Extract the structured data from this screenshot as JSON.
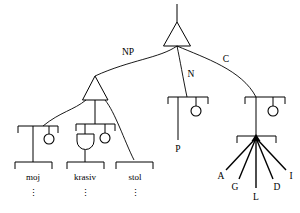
{
  "diagram": {
    "type": "linguistic-dependency-tree",
    "background_color": "#ffffff",
    "line_color": "#000000"
  },
  "labels": {
    "np": "NP",
    "n": "N",
    "c": "C",
    "p": "P"
  },
  "words": {
    "moj": "moj",
    "krasiv": "krasiv",
    "stol": "stol"
  },
  "ellipsis": {
    "moj": "⋮",
    "krasiv": "⋮",
    "stol": "⋮"
  },
  "fan_letters": {
    "a": "A",
    "g": "G",
    "l": "L",
    "d": "D",
    "i": "I"
  },
  "nodes": [
    {
      "name": "root-triangle",
      "kind": "triangle"
    },
    {
      "name": "np-triangle",
      "kind": "triangle"
    },
    {
      "name": "moj-bracket",
      "kind": "bracket"
    },
    {
      "name": "krasiv-bracket",
      "kind": "bracket"
    },
    {
      "name": "stol-bracket",
      "kind": "bracket"
    },
    {
      "name": "n-bracket",
      "kind": "bracket"
    },
    {
      "name": "c-bracket",
      "kind": "bracket"
    },
    {
      "name": "fan-bracket",
      "kind": "bracket"
    }
  ],
  "edges": [
    {
      "from": "root-triangle",
      "to": "np-triangle",
      "label": "NP"
    },
    {
      "from": "root-triangle",
      "to": "n-bracket",
      "label": "N"
    },
    {
      "from": "root-triangle",
      "to": "c-bracket",
      "label": "C"
    },
    {
      "from": "np-triangle",
      "to": "moj-bracket",
      "label": ""
    },
    {
      "from": "np-triangle",
      "to": "krasiv-bracket",
      "label": ""
    },
    {
      "from": "np-triangle",
      "to": "stol-bracket",
      "label": ""
    }
  ]
}
